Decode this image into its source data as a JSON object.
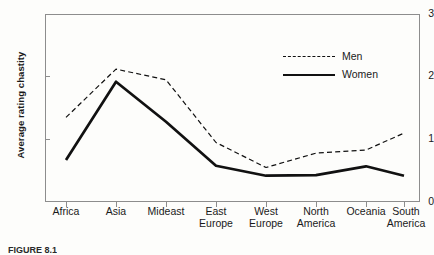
{
  "chart_data": {
    "type": "line",
    "title": "",
    "xlabel": "",
    "ylabel": "Average rating chastity",
    "ylim": [
      0,
      3
    ],
    "yticks": [
      0,
      1,
      2,
      3
    ],
    "grid": false,
    "legend_position": "upper-right-inside",
    "categories": [
      "Africa",
      "Asia",
      "Mideast",
      "East\nEurope",
      "West\nEurope",
      "North\nAmerica",
      "Oceania",
      "South\nAmerica"
    ],
    "series": [
      {
        "name": "Men",
        "style": "dashed",
        "color": "#111111",
        "values": [
          1.35,
          2.12,
          1.95,
          0.95,
          0.55,
          0.78,
          0.83,
          1.1
        ]
      },
      {
        "name": "Women",
        "style": "solid",
        "color": "#111111",
        "values": [
          0.67,
          1.92,
          1.28,
          0.58,
          0.42,
          0.43,
          0.57,
          0.42
        ]
      }
    ]
  },
  "axis": {
    "y_title": "Average rating chastity",
    "y_tick_labels": [
      "0",
      "1",
      "2",
      "3"
    ]
  },
  "legend": {
    "entries": [
      {
        "label": "Men",
        "style": "dashed"
      },
      {
        "label": "Women",
        "style": "solid"
      }
    ]
  },
  "caption": {
    "text": "FIGURE 8.1"
  }
}
